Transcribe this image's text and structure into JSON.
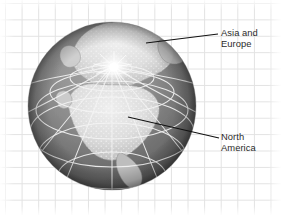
{
  "figure": {
    "background": {
      "name": "graph-paper-grid",
      "grid_color": "#e2e2e2",
      "page_color": "#ffffff",
      "cell_size_px": 16.5
    }
  },
  "globe": {
    "name": "earth-globe",
    "projection": "polar orthographic, north pole centered upper area",
    "center_x": 112,
    "center_y": 106,
    "radius": 84,
    "ocean_color": "#8c8c8c",
    "ocean_shadow_color": "#4a4a4a",
    "land_color": "#e6e6e6",
    "land_shadow_color": "#b4b4b4",
    "graticule_color": "#f2f2f2",
    "pole_highlight_color": "#ffffff",
    "landmasses": [
      {
        "name": "asia-and-europe",
        "label": "Asia and Europe"
      },
      {
        "name": "north-america",
        "label": "North America"
      }
    ]
  },
  "callouts": [
    {
      "name": "asia-and-europe",
      "label": "Asia and\nEurope",
      "text_color": "#2b2b2b",
      "leader_line": {
        "color": "#111111",
        "x1": 146,
        "y1": 43,
        "x2": 218,
        "y2": 34
      }
    },
    {
      "name": "north-america",
      "label": "North\nAmerica",
      "text_color": "#2b2b2b",
      "leader_line": {
        "color": "#111111",
        "x1": 128,
        "y1": 117,
        "x2": 219,
        "y2": 138
      }
    }
  ]
}
